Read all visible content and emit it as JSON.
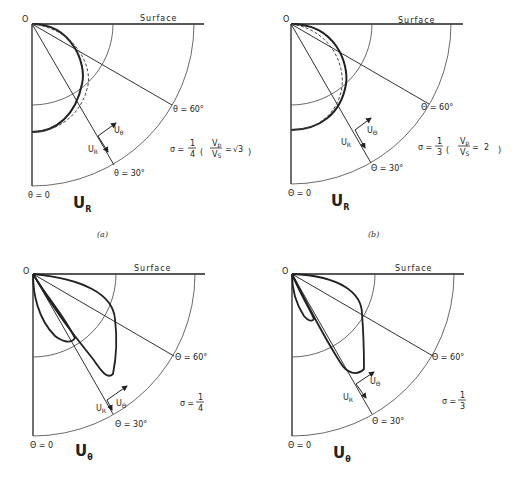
{
  "panels": [
    {
      "id": "a",
      "caption": "(a)",
      "origin_label": "O",
      "surface_label": "Surface",
      "angle_labels": [
        "θ = 60°",
        "θ = 30°",
        "θ = 0"
      ],
      "vector_labels": {
        "ur": "U",
        "ur_sub": "R",
        "ut": "U",
        "ut_sub": "θ"
      },
      "component": {
        "main": "U",
        "sub": "R"
      },
      "sigma": {
        "prefix": "σ =",
        "num": "1",
        "den": "4",
        "ratio_num": "V",
        "ratio_num_sub": "p",
        "ratio_den": "V",
        "ratio_den_sub": "S",
        "ratio_value": "√3"
      }
    },
    {
      "id": "b",
      "caption": "(b)",
      "origin_label": "O",
      "surface_label": "Surface",
      "angle_labels": [
        "Θ = 60°",
        "Θ = 30°",
        "Θ = 0"
      ],
      "vector_labels": {
        "ur": "U",
        "ur_sub": "R",
        "ut": "U",
        "ut_sub": "Θ"
      },
      "component": {
        "main": "U",
        "sub": "R"
      },
      "sigma": {
        "prefix": "σ =",
        "num": "1",
        "den": "3",
        "ratio_num": "V",
        "ratio_num_sub": "p",
        "ratio_den": "V",
        "ratio_den_sub": "S",
        "ratio_value": "2"
      }
    },
    {
      "id": "c",
      "caption": "",
      "origin_label": "O",
      "surface_label": "Surface",
      "angle_labels": [
        "Θ = 60°",
        "Θ = 30°",
        "Θ = 0"
      ],
      "vector_labels": {
        "ur": "U",
        "ur_sub": "R",
        "ut": "U",
        "ut_sub": "Θ"
      },
      "component": {
        "main": "U",
        "sub": "θ"
      },
      "sigma": {
        "prefix": "σ =",
        "num": "1",
        "den": "4"
      }
    },
    {
      "id": "d",
      "caption": "",
      "origin_label": "O",
      "surface_label": "Surface",
      "angle_labels": [
        "Θ = 60°",
        "Θ = 30°",
        "Θ = 0"
      ],
      "vector_labels": {
        "ur": "U",
        "ur_sub": "R",
        "ut": "U",
        "ut_sub": "Θ"
      },
      "component": {
        "main": "U",
        "sub": "θ"
      },
      "sigma": {
        "prefix": "σ =",
        "num": "1",
        "den": "3"
      }
    }
  ]
}
